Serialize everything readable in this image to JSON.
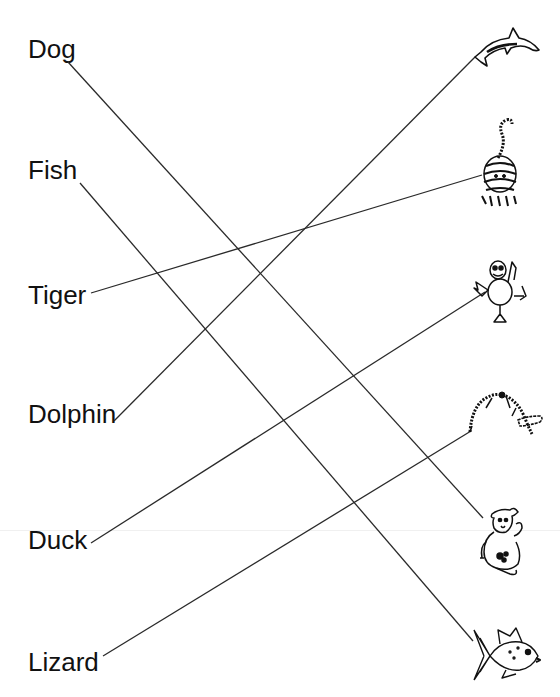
{
  "worksheet": {
    "words": [
      {
        "label": "Dog",
        "x": 28,
        "y": 36
      },
      {
        "label": "Fish",
        "x": 28,
        "y": 157
      },
      {
        "label": "Tiger",
        "x": 28,
        "y": 282
      },
      {
        "label": "Dolphin",
        "x": 28,
        "y": 401
      },
      {
        "label": "Duck",
        "x": 28,
        "y": 527
      },
      {
        "label": "Lizard",
        "x": 28,
        "y": 649
      }
    ],
    "pictures": [
      {
        "icon": "dolphin-icon",
        "y": 45
      },
      {
        "icon": "tiger-icon",
        "y": 118
      },
      {
        "icon": "duck-icon",
        "y": 258
      },
      {
        "icon": "lizard-icon",
        "y": 388
      },
      {
        "icon": "dog-icon",
        "y": 500
      },
      {
        "icon": "fish-icon",
        "y": 622
      }
    ],
    "matches": [
      {
        "word": "Dog",
        "picture": "dog-icon",
        "x1": 68,
        "y1": 62,
        "x2": 483,
        "y2": 518
      },
      {
        "word": "Fish",
        "picture": "fish-icon",
        "x1": 80,
        "y1": 183,
        "x2": 473,
        "y2": 641
      },
      {
        "word": "Tiger",
        "picture": "tiger-icon",
        "x1": 91,
        "y1": 293,
        "x2": 482,
        "y2": 175
      },
      {
        "word": "Dolphin",
        "picture": "dolphin-icon",
        "x1": 114,
        "y1": 421,
        "x2": 475,
        "y2": 57
      },
      {
        "word": "Duck",
        "picture": "duck-icon",
        "x1": 91,
        "y1": 543,
        "x2": 485,
        "y2": 292
      },
      {
        "word": "Lizard",
        "picture": "lizard-icon",
        "x1": 103,
        "y1": 656,
        "x2": 471,
        "y2": 431
      }
    ],
    "colors": {
      "ink": "#111111",
      "line": "#2a2a2a",
      "background": "#ffffff"
    }
  }
}
